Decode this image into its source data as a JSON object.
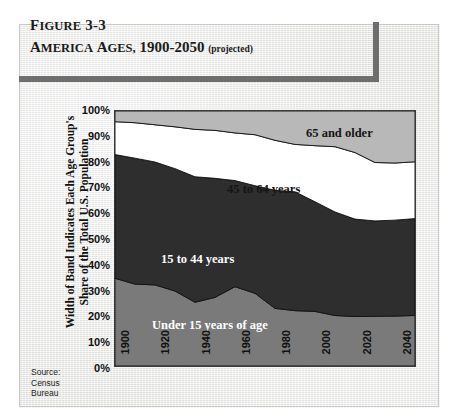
{
  "figure": {
    "number_prefix": "F",
    "number_rest": "IGURE",
    "number_value": " 3-3",
    "title_parts": [
      {
        "cap": "A",
        "sc": "MERICA"
      },
      {
        "cap": "A",
        "sc": "GES,"
      }
    ],
    "title_years": " 1900-2050",
    "projected": "(projected)"
  },
  "axis": {
    "y_caption_line1": "Width of Band Indicates Each Age Group's",
    "y_caption_line2": "Share of the Total U.S. Population"
  },
  "source": {
    "line1": "Source:",
    "line2": "Census",
    "line3": "Bureau"
  },
  "band_labels": {
    "older_65": "65 and older",
    "years_45_64": "45 to 64 years",
    "years_15_44": "15 to 44 years",
    "under_15": "Under 15 years of age"
  },
  "colors": {
    "under_15": "#7a7a7a",
    "years_15_44": "#2e2e2e",
    "years_45_64": "#ffffff",
    "older_65": "#b8b8b8",
    "rule": "#6e6e6e",
    "plot_border": "#3a3a3a",
    "panel": "#ececea"
  },
  "chart_data": {
    "type": "area",
    "subtitle": "",
    "xlabel": "",
    "ylabel": "Width of Band Indicates Each Age Group's Share of the Total U.S. Population",
    "stacked": true,
    "percent": true,
    "grid": false,
    "legend": "inline-band-labels",
    "xlim": [
      1900,
      2050
    ],
    "ylim": [
      0,
      100
    ],
    "xticks": [
      1900,
      1920,
      1940,
      1960,
      1980,
      2000,
      2020,
      2040
    ],
    "yticks": [
      0,
      10,
      20,
      30,
      40,
      50,
      60,
      70,
      80,
      90,
      100
    ],
    "ytick_labels": [
      "0%",
      "10%",
      "20%",
      "30%",
      "40%",
      "50%",
      "60%",
      "70%",
      "80%",
      "90%",
      "100%"
    ],
    "x": [
      1900,
      1910,
      1920,
      1930,
      1940,
      1950,
      1960,
      1970,
      1980,
      1990,
      2000,
      2010,
      2020,
      2030,
      2040,
      2050
    ],
    "series": [
      {
        "name": "Under 15 years of age",
        "color": "#7a7a7a",
        "values": [
          34.4,
          32.1,
          31.8,
          29.4,
          25.0,
          26.9,
          31.1,
          28.5,
          22.6,
          21.7,
          21.4,
          19.8,
          19.4,
          19.5,
          19.6,
          19.8
        ]
      },
      {
        "name": "15 to 44 years",
        "color": "#2e2e2e",
        "values": [
          48.5,
          49.4,
          48.2,
          48.0,
          49.2,
          46.7,
          41.6,
          42.2,
          46.3,
          46.6,
          43.0,
          40.6,
          38.2,
          37.4,
          37.6,
          38.0
        ]
      },
      {
        "name": "45 to 64 years",
        "color": "#ffffff",
        "values": [
          12.9,
          13.9,
          14.6,
          16.4,
          18.6,
          18.8,
          18.7,
          20.0,
          19.6,
          18.6,
          22.0,
          25.6,
          26.1,
          22.9,
          22.4,
          22.3
        ]
      },
      {
        "name": "65 and older",
        "color": "#b8b8b8",
        "values": [
          4.2,
          4.6,
          5.4,
          6.2,
          7.2,
          7.6,
          8.6,
          9.3,
          11.5,
          13.1,
          13.6,
          14.0,
          16.3,
          20.2,
          20.4,
          19.9
        ]
      }
    ],
    "cumulative_tops": {
      "under_15": [
        34.4,
        32.1,
        31.8,
        29.4,
        25.0,
        26.9,
        31.1,
        28.5,
        22.6,
        21.7,
        21.4,
        19.8,
        19.4,
        19.5,
        19.6,
        19.8
      ],
      "through_15_44": [
        82.9,
        81.5,
        80.0,
        77.4,
        74.2,
        73.6,
        72.7,
        70.7,
        68.9,
        68.3,
        64.4,
        60.4,
        57.6,
        56.9,
        57.2,
        57.8
      ],
      "through_45_64": [
        95.8,
        95.4,
        94.6,
        93.8,
        92.8,
        92.4,
        91.4,
        90.7,
        88.5,
        86.9,
        86.4,
        86.0,
        83.7,
        79.8,
        79.6,
        80.1
      ],
      "through_65_plus": [
        100,
        100,
        100,
        100,
        100,
        100,
        100,
        100,
        100,
        100,
        100,
        100,
        100,
        100,
        100,
        100
      ]
    }
  },
  "x_tick_labels": [
    "1900",
    "1920",
    "1940",
    "1960",
    "1980",
    "2000",
    "2020",
    "2040"
  ]
}
